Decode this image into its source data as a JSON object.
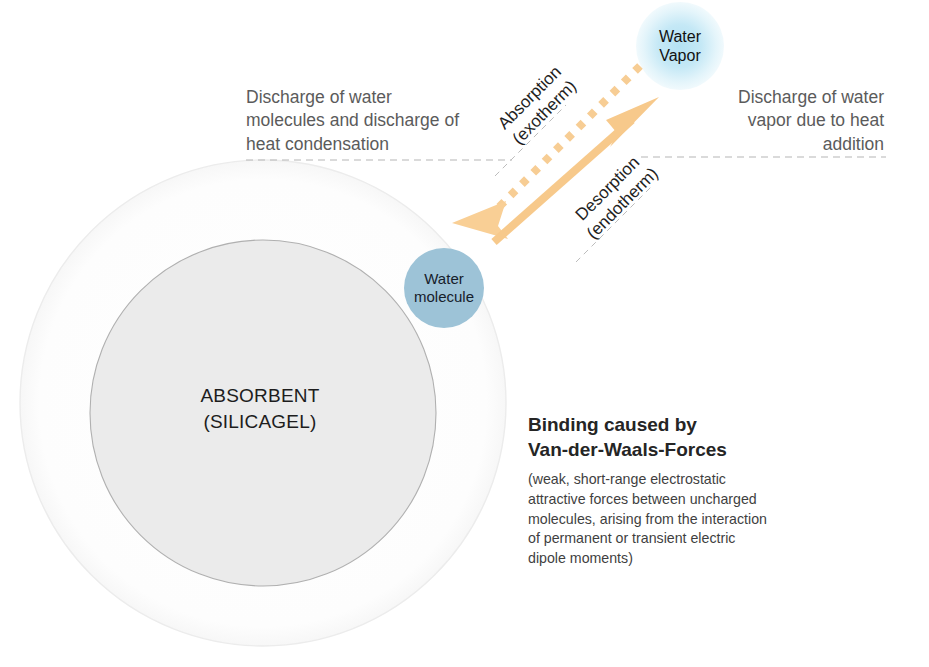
{
  "diagram": {
    "title_left": "Discharge of water\nmolecules and discharge of\nheat condensation",
    "title_right": "Discharge of water\nvapor due to heat\naddition",
    "arrows": {
      "absorption_label": "Absorption\n(exotherm)",
      "desorption_label": "Desorption\n(endotherm)"
    },
    "bubbles": {
      "water_vapor": "Water\nVapor",
      "water_molecule": "Water\nmolecule"
    },
    "absorbent_label": "ABSORBENT\n(SILICAGEL)",
    "binding": {
      "title": "Binding caused by\nVan-der-Waals-Forces",
      "description": "(weak, short-range electrostatic\nattractive forces between uncharged\nmolecules, arising from the interaction\nof permanent or transient electric\ndipole moments)"
    },
    "colors": {
      "arrow": "#f6c98a",
      "water_molecule_fill": "#9dc3d7",
      "water_vapor_glow": "#b0e0f2",
      "absorbent_fill": "#ebebeb",
      "absorbent_stroke": "#b8b8b8",
      "outer_circle_stroke": "#f0f0f0",
      "dashed_leader": "#b4b4b4",
      "heading_text": "#5b5b5b",
      "body_text": "#3f3f3f"
    }
  }
}
